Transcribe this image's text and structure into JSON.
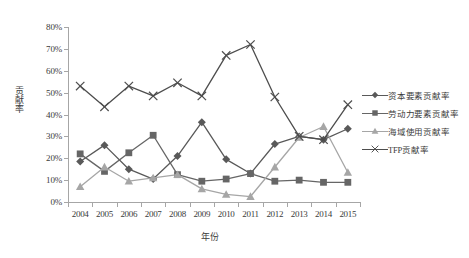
{
  "chart_data": {
    "type": "line",
    "title": "",
    "xlabel": "年份",
    "ylabel": "贡献率",
    "categories": [
      "2004",
      "2005",
      "2006",
      "2007",
      "2008",
      "2009",
      "2010",
      "2011",
      "2012",
      "2013",
      "2014",
      "2015"
    ],
    "ylim": [
      0,
      80
    ],
    "ytick_labels": [
      "0%",
      "10%",
      "20%",
      "30%",
      "40%",
      "50%",
      "60%",
      "70%",
      "80%"
    ],
    "ytick_values": [
      0,
      10,
      20,
      30,
      40,
      50,
      60,
      70,
      80
    ],
    "grid": false,
    "legend_position": "right",
    "series": [
      {
        "name": "资本要素贡献率",
        "marker": "diamond",
        "color": "#595959",
        "values": [
          18.5,
          26.0,
          15.0,
          10.5,
          21.0,
          36.5,
          19.5,
          13.0,
          26.5,
          30.0,
          28.5,
          33.5
        ]
      },
      {
        "name": "劳动力要素贡献率",
        "marker": "square",
        "color": "#666666",
        "values": [
          22.0,
          14.0,
          22.5,
          30.5,
          12.5,
          9.5,
          10.5,
          13.0,
          9.5,
          10.0,
          9.0,
          9.0
        ]
      },
      {
        "name": "海域使用贡献率",
        "marker": "triangle",
        "color": "#a6a6a6",
        "values": [
          7.0,
          16.0,
          9.5,
          11.0,
          12.5,
          6.0,
          3.5,
          2.5,
          16.0,
          29.5,
          34.5,
          13.5
        ]
      },
      {
        "name": "TFP贡献率",
        "marker": "cross",
        "color": "#4d4d4d",
        "values": [
          53.0,
          43.5,
          53.0,
          48.5,
          54.5,
          48.5,
          67.0,
          72.0,
          48.0,
          30.0,
          28.5,
          44.5
        ]
      }
    ]
  },
  "colors": {
    "axis": "#a6a6a6",
    "text": "#3b3b3b",
    "background": "#ffffff"
  }
}
